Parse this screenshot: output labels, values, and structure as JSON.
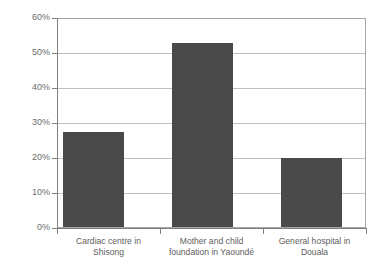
{
  "chart_data": {
    "type": "bar",
    "title": "",
    "subtitle": "",
    "xlabel": "",
    "ylabel": "",
    "categories": [
      "Cardiac centre in Shisong",
      "Mother and child foundation in Yaoundé",
      "General hospital in Douala"
    ],
    "category_lines": [
      [
        "Cardiac centre in",
        "Shisong"
      ],
      [
        "Mother and child",
        "foundation in Yaoundé"
      ],
      [
        "General hospital in",
        "Douala"
      ]
    ],
    "values": [
      27.5,
      53,
      20
    ],
    "value_unit": "%",
    "ylim": [
      0,
      60
    ],
    "ytick_values": [
      0,
      10,
      20,
      30,
      40,
      50,
      60
    ],
    "ytick_labels": [
      "0%",
      "10%",
      "20%",
      "30%",
      "40%",
      "50%",
      "60%"
    ],
    "grid": true,
    "grid_axis": "y",
    "legend": false,
    "legend_position": "none",
    "bar_color": "#4a4a4a",
    "gridline_color": "#bfbfbf",
    "axis_color": "#808080",
    "frame_color": "#a6a6a6",
    "label_color": "#5e5e5e",
    "background": "#ffffff"
  }
}
